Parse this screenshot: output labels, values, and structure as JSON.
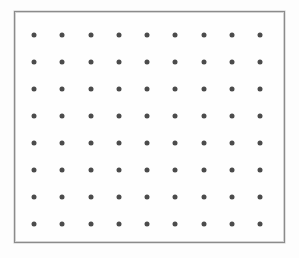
{
  "figure": {
    "title": "",
    "background_color": "#fdfdfd",
    "panel": {
      "name": "dot-grid-panel",
      "fill_color": "#fefefe",
      "border_color": "#8b8b8b",
      "border_width_px": 1,
      "left_px": 14,
      "top_px": 11,
      "width_px": 271,
      "height_px": 232
    },
    "marker": {
      "shape": "circle",
      "color": "#4b4b4b",
      "diameter_px": 5
    }
  },
  "chart_data": {
    "type": "scatter",
    "title": "",
    "subtitle": "",
    "xlabel": "",
    "ylabel": "",
    "legend": [],
    "annotations": [],
    "grid": false,
    "axis_ticks": {
      "x": [],
      "y": []
    },
    "xlim": [
      0,
      8
    ],
    "ylim": [
      0,
      7
    ],
    "layout": {
      "columns": 9,
      "rows": 8,
      "first_dot_center_px": [
        33,
        34
      ],
      "column_spacing_px": 28.25,
      "row_spacing_px": 27.0
    },
    "series": [
      {
        "name": "lattice-points",
        "marker": "circle",
        "color": "#4b4b4b",
        "x": [
          0,
          1,
          2,
          3,
          4,
          5,
          6,
          7,
          8,
          0,
          1,
          2,
          3,
          4,
          5,
          6,
          7,
          8,
          0,
          1,
          2,
          3,
          4,
          5,
          6,
          7,
          8,
          0,
          1,
          2,
          3,
          4,
          5,
          6,
          7,
          8,
          0,
          1,
          2,
          3,
          4,
          5,
          6,
          7,
          8,
          0,
          1,
          2,
          3,
          4,
          5,
          6,
          7,
          8,
          0,
          1,
          2,
          3,
          4,
          5,
          6,
          7,
          8,
          0,
          1,
          2,
          3,
          4,
          5,
          6,
          7,
          8
        ],
        "y": [
          7,
          7,
          7,
          7,
          7,
          7,
          7,
          7,
          7,
          6,
          6,
          6,
          6,
          6,
          6,
          6,
          6,
          6,
          5,
          5,
          5,
          5,
          5,
          5,
          5,
          5,
          5,
          4,
          4,
          4,
          4,
          4,
          4,
          4,
          4,
          4,
          3,
          3,
          3,
          3,
          3,
          3,
          3,
          3,
          3,
          2,
          2,
          2,
          2,
          2,
          2,
          2,
          2,
          2,
          1,
          1,
          1,
          1,
          1,
          1,
          1,
          1,
          1,
          0,
          0,
          0,
          0,
          0,
          0,
          0,
          0,
          0
        ]
      }
    ],
    "point_count": 72
  }
}
